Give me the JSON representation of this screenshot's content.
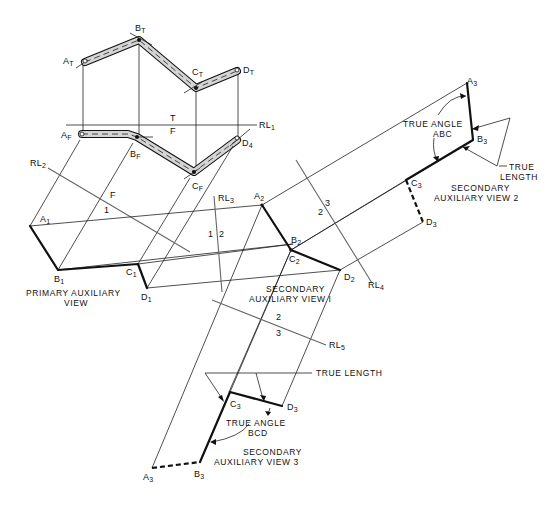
{
  "figure": {
    "reference_lines": {
      "rl1": {
        "name": "RL",
        "sub": "1",
        "top": "T",
        "bottom": "F"
      },
      "rl2": {
        "name": "RL",
        "sub": "2",
        "top": "F",
        "bottom": "1"
      },
      "rl3": {
        "name": "RL",
        "sub": "3",
        "left": "1",
        "right": "2"
      },
      "rl4": {
        "name": "RL",
        "sub": "4",
        "left": "2",
        "right": "3"
      },
      "rl5": {
        "name": "RL",
        "sub": "5",
        "top": "2",
        "bottom": "3"
      }
    },
    "top_view": {
      "points": [
        {
          "id": "A",
          "sub": "T"
        },
        {
          "id": "B",
          "sub": "T"
        },
        {
          "id": "C",
          "sub": "T"
        },
        {
          "id": "D",
          "sub": "T"
        }
      ]
    },
    "front_view": {
      "points": [
        {
          "id": "A",
          "sub": "F"
        },
        {
          "id": "B",
          "sub": "F"
        },
        {
          "id": "C",
          "sub": "F"
        },
        {
          "id": "D",
          "sub": "4"
        }
      ]
    },
    "primary_auxiliary": {
      "caption_line1": "PRIMARY AUXILIARY",
      "caption_line2": "VIEW",
      "points": [
        {
          "id": "A",
          "sub": "1"
        },
        {
          "id": "B",
          "sub": "1"
        },
        {
          "id": "C",
          "sub": "1"
        },
        {
          "id": "D",
          "sub": "1"
        }
      ]
    },
    "secondary_auxiliary_1": {
      "caption_line1": "SECONDARY",
      "caption_line2": "AUXILIARY VIEW I",
      "points": [
        {
          "id": "A",
          "sub": "2"
        },
        {
          "id": "B",
          "sub": "2"
        },
        {
          "id": "C",
          "sub": "2"
        },
        {
          "id": "D",
          "sub": "2"
        }
      ]
    },
    "secondary_auxiliary_2": {
      "caption_line1": "SECONDARY",
      "caption_line2": "AUXILIARY VIEW 2",
      "true_angle_line1": "TRUE ANGLE",
      "true_angle_line2": "ABC",
      "true_length_line1": "TRUE",
      "true_length_line2": "LENGTH",
      "points": [
        {
          "id": "A",
          "sub": "3"
        },
        {
          "id": "B",
          "sub": "3"
        },
        {
          "id": "C",
          "sub": "3"
        },
        {
          "id": "D",
          "sub": "3"
        }
      ]
    },
    "secondary_auxiliary_3": {
      "caption_line1": "SECONDARY",
      "caption_line2": "AUXILIARY VIEW 3",
      "true_angle_line1": "TRUE ANGLE",
      "true_angle_line2": "BCD",
      "true_length": "TRUE LENGTH",
      "points": [
        {
          "id": "A",
          "sub": "3"
        },
        {
          "id": "B",
          "sub": "3"
        },
        {
          "id": "C",
          "sub": "3"
        },
        {
          "id": "D",
          "sub": "3"
        }
      ]
    }
  }
}
